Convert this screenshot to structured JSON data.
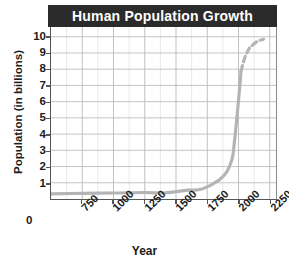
{
  "chart_data": {
    "type": "line",
    "title": "Human Population Growth",
    "xlabel": "Year",
    "ylabel": "Population (in billions)",
    "xlim": [
      500,
      2300
    ],
    "ylim": [
      0,
      10.6
    ],
    "grid": true,
    "legend": "none",
    "y_zero_label": "0",
    "yticks": [
      1,
      2,
      3,
      4,
      5,
      6,
      7,
      8,
      9,
      10
    ],
    "ytick_labels": [
      "1",
      "2",
      "3",
      "4",
      "5",
      "6",
      "7",
      "8",
      "9",
      "10"
    ],
    "xticks": [
      750,
      1000,
      1250,
      1500,
      1750,
      2000,
      2250
    ],
    "xtick_labels": [
      "750",
      "1000",
      "1250",
      "1500",
      "1750",
      "2000",
      "2250"
    ],
    "x_minor_step": 125,
    "series": [
      {
        "name": "Observed population",
        "style": "solid",
        "color": "#b4b4b4",
        "x": [
          500,
          750,
          1000,
          1250,
          1400,
          1500,
          1600,
          1650,
          1700,
          1750,
          1800,
          1850,
          1900,
          1927,
          1950,
          1960,
          1974,
          1987,
          1999,
          2011,
          2020
        ],
        "y": [
          0.32,
          0.35,
          0.37,
          0.4,
          0.37,
          0.45,
          0.55,
          0.55,
          0.6,
          0.75,
          0.95,
          1.2,
          1.6,
          2.0,
          2.5,
          3.0,
          4.0,
          5.0,
          6.0,
          7.0,
          7.9
        ]
      },
      {
        "name": "Projected population",
        "style": "dashed",
        "color": "#b4b4b4",
        "x": [
          2020,
          2050,
          2080,
          2100,
          2150,
          2200
        ],
        "y": [
          7.9,
          8.7,
          9.2,
          9.4,
          9.7,
          9.85
        ]
      }
    ],
    "colors": {
      "title_banner": "#2b2b2b",
      "title_text": "#ffffff",
      "curve": "#b4b4b4",
      "grid_minor": "#e2e2e2",
      "grid_major": "#b9b9b9",
      "axis": "#555555",
      "text": "#1c1c1c",
      "plot_background": "#ffffff"
    }
  }
}
